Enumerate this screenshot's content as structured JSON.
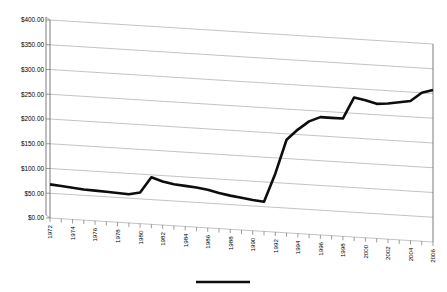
{
  "chart_data": {
    "type": "line",
    "title": "",
    "subtitle": "",
    "xlabel": "",
    "ylabel": "",
    "ylim": [
      0,
      400
    ],
    "y_ticks": [
      0,
      50,
      100,
      150,
      200,
      250,
      300,
      350,
      400
    ],
    "y_tick_labels": [
      "$0.00",
      "$50.00",
      "$100.00",
      "$150.00",
      "$200.00",
      "$250.00",
      "$300.00",
      "$350.00",
      "$400.00"
    ],
    "grid": true,
    "grid_orientation": "horizontal",
    "perspective_3d": true,
    "legend_position": "bottom",
    "legend_label": "",
    "x": [
      1972,
      1973,
      1974,
      1975,
      1976,
      1977,
      1978,
      1979,
      1980,
      1981,
      1982,
      1983,
      1984,
      1985,
      1986,
      1987,
      1988,
      1989,
      1990,
      1991,
      1992,
      1993,
      1994,
      1995,
      1996,
      1997,
      1998,
      1999,
      2000,
      2001,
      2002,
      2003,
      2004,
      2005,
      2006
    ],
    "x_tick_labels": [
      "1972",
      "1974",
      "1976",
      "1978",
      "1980",
      "1982",
      "1984",
      "1986",
      "1988",
      "1990",
      "1992",
      "1994",
      "1996",
      "1998",
      "2000",
      "2002",
      "2004",
      "2006"
    ],
    "x_label_step": 2,
    "xlim": [
      1972,
      2006
    ],
    "series": [
      {
        "name": "",
        "color": "#0d0d0d",
        "values": [
          68,
          66,
          64,
          62,
          61,
          60,
          59,
          58,
          63,
          95,
          88,
          84,
          82,
          80,
          77,
          72,
          68,
          65,
          62,
          60,
          118,
          188,
          210,
          228,
          238,
          238,
          238,
          282,
          278,
          272,
          274,
          278,
          282,
          300,
          307
        ]
      }
    ]
  }
}
